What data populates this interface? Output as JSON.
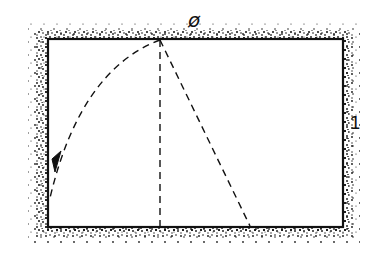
{
  "diagram": {
    "type": "geometric construction",
    "labels": {
      "angle_symbol": "ø",
      "side_label": "1"
    },
    "rectangle": {
      "left": 48,
      "top": 39,
      "right": 343,
      "bottom": 227,
      "border_style": "solid with stippled (hatched) outer edge"
    },
    "vertex": {
      "x": 160,
      "y": 39
    },
    "lines": [
      {
        "name": "vertical-dashed",
        "from": [
          160,
          39
        ],
        "to": [
          160,
          227
        ],
        "style": "dashed"
      },
      {
        "name": "diagonal-dashed",
        "from": [
          160,
          39
        ],
        "to": [
          250,
          227
        ],
        "style": "dashed"
      },
      {
        "name": "arc-dashed",
        "from": [
          160,
          39
        ],
        "to": [
          50,
          198
        ],
        "style": "dashed arc with arrowhead"
      }
    ],
    "colors": {
      "ink": "#111111",
      "background": "#ffffff"
    }
  }
}
